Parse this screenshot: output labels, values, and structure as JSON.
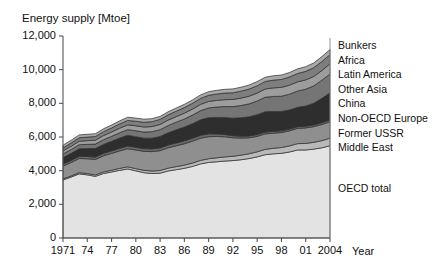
{
  "chart_data": {
    "type": "area",
    "title": "Energy supply [Mtoe]",
    "xlabel": "Year",
    "ylabel": "Energy supply [Mtoe]",
    "ylim": [
      0,
      12000
    ],
    "xlim": [
      1971,
      2004
    ],
    "grid": false,
    "legend_position": "right",
    "ytick_labels": [
      "12,000",
      "10,000",
      "8,000",
      "6,000",
      "4,000",
      "2,000",
      "0"
    ],
    "ytick_values": [
      12000,
      10000,
      8000,
      6000,
      4000,
      2000,
      0
    ],
    "xtick_labels": [
      "1971",
      "74",
      "77",
      "80",
      "83",
      "86",
      "89",
      "92",
      "95",
      "98",
      "01",
      "2004"
    ],
    "xtick_values": [
      1971,
      1974,
      1977,
      1980,
      1983,
      1986,
      1989,
      1992,
      1995,
      1998,
      2001,
      2004
    ],
    "x": [
      1971,
      1972,
      1973,
      1974,
      1975,
      1976,
      1977,
      1978,
      1979,
      1980,
      1981,
      1982,
      1983,
      1984,
      1985,
      1986,
      1987,
      1988,
      1989,
      1990,
      1991,
      1992,
      1993,
      1994,
      1995,
      1996,
      1997,
      1998,
      1999,
      2000,
      2001,
      2002,
      2003,
      2004
    ],
    "series": [
      {
        "name": "OECD total",
        "color": "#e3e3e3",
        "values": [
          3450,
          3620,
          3810,
          3750,
          3660,
          3830,
          3920,
          4020,
          4100,
          3990,
          3880,
          3830,
          3850,
          3980,
          4060,
          4140,
          4250,
          4400,
          4490,
          4530,
          4570,
          4600,
          4650,
          4720,
          4820,
          4950,
          5000,
          5030,
          5110,
          5230,
          5230,
          5280,
          5360,
          5480
        ]
      },
      {
        "name": "Middle East",
        "color": "#b9b9b9",
        "values": [
          60,
          65,
          72,
          78,
          86,
          95,
          105,
          115,
          125,
          130,
          140,
          150,
          160,
          170,
          180,
          190,
          200,
          210,
          220,
          235,
          245,
          255,
          270,
          285,
          300,
          315,
          330,
          345,
          360,
          375,
          390,
          405,
          425,
          445
        ]
      },
      {
        "name": "Former USSR",
        "color": "#8f8f8f",
        "values": [
          760,
          800,
          840,
          880,
          920,
          960,
          1000,
          1040,
          1080,
          1110,
          1130,
          1150,
          1180,
          1210,
          1240,
          1270,
          1300,
          1320,
          1310,
          1270,
          1200,
          1100,
          1020,
          950,
          920,
          920,
          900,
          890,
          900,
          910,
          920,
          930,
          960,
          980
        ]
      },
      {
        "name": "Non-OECD Europe",
        "color": "#6a6a6a",
        "values": [
          120,
          125,
          130,
          135,
          140,
          145,
          150,
          155,
          158,
          160,
          160,
          160,
          162,
          165,
          168,
          170,
          172,
          172,
          168,
          150,
          135,
          120,
          112,
          105,
          105,
          108,
          105,
          102,
          100,
          100,
          102,
          104,
          106,
          108
        ]
      },
      {
        "name": "China",
        "color": "#2e2e2e",
        "values": [
          390,
          420,
          450,
          470,
          510,
          530,
          570,
          610,
          640,
          630,
          620,
          640,
          680,
          730,
          780,
          820,
          870,
          920,
          960,
          980,
          1010,
          1040,
          1090,
          1140,
          1180,
          1210,
          1180,
          1150,
          1140,
          1150,
          1200,
          1290,
          1450,
          1610
        ]
      },
      {
        "name": "Other Asia",
        "color": "#757575",
        "values": [
          210,
          225,
          240,
          250,
          265,
          280,
          295,
          315,
          335,
          350,
          365,
          385,
          405,
          430,
          455,
          480,
          510,
          545,
          580,
          615,
          650,
          690,
          730,
          770,
          815,
          860,
          895,
          905,
          935,
          970,
          1000,
          1030,
          1075,
          1120
        ]
      },
      {
        "name": "Latin America",
        "color": "#9d9d9d",
        "values": [
          185,
          195,
          210,
          220,
          230,
          245,
          255,
          270,
          285,
          295,
          300,
          305,
          310,
          320,
          330,
          345,
          355,
          370,
          385,
          395,
          410,
          425,
          440,
          455,
          470,
          490,
          510,
          525,
          535,
          545,
          550,
          560,
          575,
          600
        ]
      },
      {
        "name": "Africa",
        "color": "#7e7e7e",
        "values": [
          180,
          190,
          200,
          210,
          220,
          230,
          240,
          250,
          262,
          272,
          282,
          292,
          300,
          310,
          322,
          332,
          344,
          356,
          366,
          378,
          390,
          400,
          412,
          424,
          436,
          448,
          460,
          472,
          484,
          496,
          508,
          520,
          535,
          550
        ]
      },
      {
        "name": "Bunkers",
        "color": "#a8a8a8",
        "values": [
          160,
          165,
          172,
          168,
          165,
          172,
          178,
          184,
          190,
          185,
          180,
          178,
          178,
          184,
          188,
          194,
          200,
          208,
          214,
          218,
          222,
          228,
          232,
          238,
          244,
          250,
          258,
          262,
          268,
          276,
          278,
          284,
          294,
          305
        ]
      }
    ],
    "legend_entries": [
      "Bunkers",
      "Africa",
      "Latin America",
      "Other Asia",
      "China",
      "Non-OECD Europe",
      "Former USSR",
      "Middle East"
    ],
    "inline_labels": [
      {
        "text": "OECD total"
      }
    ]
  }
}
